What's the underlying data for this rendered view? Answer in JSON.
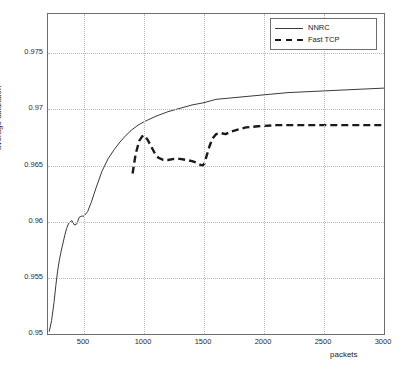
{
  "chart_data": {
    "type": "line",
    "title": "",
    "xlabel": "packets",
    "ylabel": "average utilization",
    "xlim": [
      200,
      3000
    ],
    "ylim": [
      0.95,
      0.9785
    ],
    "grid": true,
    "legend_position": "top-right",
    "xticks": [
      500,
      1000,
      1500,
      2000,
      2500,
      3000
    ],
    "xtick_labels": [
      "500",
      "1000",
      "1500",
      "2000",
      "2500",
      "3000"
    ],
    "yticks": [
      0.95,
      0.955,
      0.96,
      0.965,
      0.97,
      0.975
    ],
    "ytick_labels": [
      "0.95",
      "0.955",
      "0.96",
      "0.965",
      "0.97",
      "0.975"
    ],
    "series": [
      {
        "name": "NNRC",
        "style": "solid",
        "color": "#3a3a3a",
        "x": [
          210,
          230,
          250,
          265,
          280,
          295,
          310,
          325,
          340,
          355,
          370,
          385,
          400,
          420,
          440,
          460,
          480,
          500,
          530,
          560,
          600,
          650,
          700,
          750,
          800,
          850,
          900,
          950,
          1000,
          1100,
          1200,
          1300,
          1400,
          1500,
          1600,
          1700,
          1800,
          1900,
          2000,
          2200,
          2400,
          2600,
          2800,
          3000
        ],
        "y": [
          0.9502,
          0.9512,
          0.9528,
          0.9543,
          0.9556,
          0.9566,
          0.9574,
          0.9581,
          0.9588,
          0.9594,
          0.9598,
          0.96,
          0.9601,
          0.9597,
          0.9598,
          0.9604,
          0.9605,
          0.9605,
          0.9609,
          0.9617,
          0.963,
          0.9645,
          0.9656,
          0.9664,
          0.9671,
          0.9677,
          0.9682,
          0.9686,
          0.9689,
          0.9694,
          0.9698,
          0.9701,
          0.9704,
          0.9706,
          0.9709,
          0.971,
          0.9711,
          0.9712,
          0.9713,
          0.9715,
          0.9716,
          0.9717,
          0.9718,
          0.9719
        ]
      },
      {
        "name": "Fast TCP",
        "style": "dashed",
        "color": "#1a1a1a",
        "x": [
          905,
          930,
          960,
          985,
          1000,
          1030,
          1060,
          1090,
          1120,
          1160,
          1200,
          1250,
          1300,
          1350,
          1400,
          1450,
          1480,
          1500,
          1520,
          1545,
          1570,
          1600,
          1640,
          1680,
          1720,
          1780,
          1850,
          1950,
          2100,
          2300,
          2600,
          3000
        ],
        "y": [
          0.9643,
          0.966,
          0.9672,
          0.9676,
          0.9677,
          0.9673,
          0.9667,
          0.9661,
          0.9657,
          0.9655,
          0.9655,
          0.9656,
          0.9656,
          0.9655,
          0.9654,
          0.9652,
          0.965,
          0.9651,
          0.9658,
          0.9667,
          0.9674,
          0.9678,
          0.9679,
          0.9678,
          0.968,
          0.9682,
          0.9684,
          0.9685,
          0.9686,
          0.9686,
          0.9686,
          0.9686
        ]
      }
    ]
  },
  "legend": {
    "items": [
      {
        "label": "NNRC"
      },
      {
        "label": "Fast TCP"
      }
    ]
  },
  "axes": {
    "xlabel": "packets",
    "ylabel": "average utilization"
  }
}
